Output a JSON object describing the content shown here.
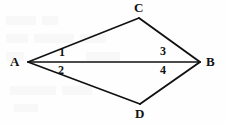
{
  "figure": {
    "background_color": "#fefefe",
    "stroke_color": "#111111",
    "vertices": [
      {
        "id": "A",
        "label": "A",
        "x": 28,
        "y": 62,
        "label_x": 10,
        "label_y": 55
      },
      {
        "id": "C",
        "label": "C",
        "x": 139,
        "y": 18,
        "label_x": 134,
        "label_y": 1
      },
      {
        "id": "B",
        "label": "B",
        "x": 200,
        "y": 62,
        "label_x": 206,
        "label_y": 55
      },
      {
        "id": "D",
        "label": "D",
        "x": 140,
        "y": 104,
        "label_x": 135,
        "label_y": 107
      }
    ],
    "edges": [
      {
        "id": "AC",
        "from": "A",
        "to": "C",
        "x1": 28,
        "y1": 62,
        "x2": 139,
        "y2": 18,
        "width": 1.6
      },
      {
        "id": "CB",
        "from": "C",
        "to": "B",
        "x1": 139,
        "y1": 18,
        "x2": 200,
        "y2": 62,
        "width": 1.9
      },
      {
        "id": "AD",
        "from": "A",
        "to": "D",
        "x1": 28,
        "y1": 62,
        "x2": 140,
        "y2": 104,
        "width": 1.7
      },
      {
        "id": "DB",
        "from": "D",
        "to": "B",
        "x1": 140,
        "y1": 104,
        "x2": 200,
        "y2": 62,
        "width": 1.9
      },
      {
        "id": "AB",
        "from": "A",
        "to": "B",
        "x1": 28,
        "y1": 62,
        "x2": 200,
        "y2": 62,
        "width": 1.5
      }
    ],
    "angle_labels": [
      {
        "id": "angle-1",
        "label": "1",
        "x": 59,
        "y": 46,
        "description": "angle CAB at vertex A above diagonal"
      },
      {
        "id": "angle-2",
        "label": "2",
        "x": 58,
        "y": 64,
        "description": "angle DAB at vertex A below diagonal"
      },
      {
        "id": "angle-3",
        "label": "3",
        "x": 160,
        "y": 45,
        "description": "angle CBA at vertex B above diagonal"
      },
      {
        "id": "angle-4",
        "label": "4",
        "x": 160,
        "y": 64,
        "description": "angle DBA at vertex B below diagonal"
      }
    ]
  }
}
